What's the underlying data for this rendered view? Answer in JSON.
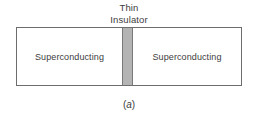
{
  "figure": {
    "caption_prefix": "(",
    "caption_letter": "a",
    "caption_suffix": ")",
    "barrier_label": {
      "line1": "Thin",
      "line2": "Insulator"
    },
    "regions": [
      {
        "label": "Superconducting"
      },
      {
        "label": "Superconducting"
      }
    ],
    "colors": {
      "barrier_fill": "#b4b4b4",
      "barrier_edge": "#7a7a7a",
      "box_border": "#6d6d6d",
      "background": "#ffffff",
      "text": "#3d3d3d"
    }
  }
}
